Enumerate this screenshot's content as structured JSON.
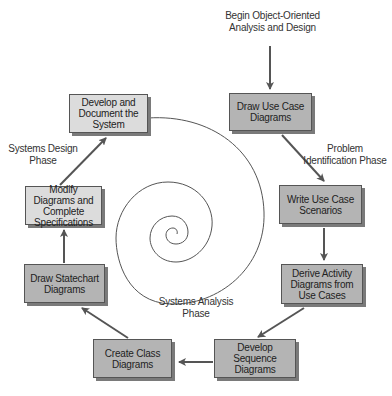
{
  "diagram": {
    "type": "process-cycle",
    "start_label": "Begin Object-Oriented Analysis and Design",
    "boxes": [
      {
        "id": "draw-use-case",
        "label": "Draw Use Case Diagrams",
        "shade": "dark"
      },
      {
        "id": "write-scenarios",
        "label": "Write Use Case Scenarios",
        "shade": "dark"
      },
      {
        "id": "derive-activity",
        "label": "Derive Activity Diagrams from Use Cases",
        "shade": "dark"
      },
      {
        "id": "develop-sequence",
        "label": "Develop Sequence Diagrams",
        "shade": "dark"
      },
      {
        "id": "create-class",
        "label": "Create Class Diagrams",
        "shade": "dark"
      },
      {
        "id": "draw-statechart",
        "label": "Draw Statechart Diagrams",
        "shade": "dark"
      },
      {
        "id": "modify-diagrams",
        "label": "Modify Diagrams and Complete Specifications",
        "shade": "light"
      },
      {
        "id": "develop-document",
        "label": "Develop and Document the System",
        "shade": "light"
      }
    ],
    "phases": [
      {
        "id": "problem-identification",
        "label": "Problem Identification Phase"
      },
      {
        "id": "systems-analysis",
        "label": "Systems Analysis Phase"
      },
      {
        "id": "systems-design",
        "label": "Systems Design Phase"
      }
    ],
    "flow": [
      "Begin Object-Oriented Analysis and Design",
      "Draw Use Case Diagrams",
      "Write Use Case Scenarios",
      "Derive Activity Diagrams from Use Cases",
      "Develop Sequence Diagrams",
      "Create Class Diagrams",
      "Draw Statechart Diagrams",
      "Modify Diagrams and Complete Specifications",
      "Develop and Document the System"
    ],
    "center_graphic": "spiral",
    "colors": {
      "dark_box": "#b4b4b4",
      "light_box": "#dcdcdc",
      "arrow": "#555555",
      "spiral": "#555555"
    }
  }
}
